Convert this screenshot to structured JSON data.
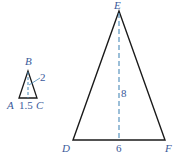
{
  "small_triangle": {
    "vertices": {
      "apex": "B",
      "left": "A",
      "right": "C"
    },
    "height_label": "2",
    "base_label": "1.5"
  },
  "large_triangle": {
    "vertices": {
      "apex": "E",
      "left": "D",
      "right": "F"
    },
    "height_label": "8",
    "base_label": "6"
  },
  "colors": {
    "stroke": "#1a1a1a",
    "dashed": "#4a8ab8",
    "label": "#3a5a9a"
  }
}
